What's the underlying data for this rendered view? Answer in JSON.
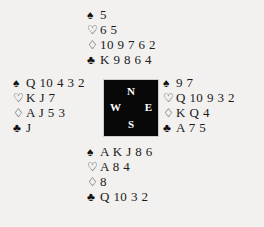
{
  "deal": {
    "suit_symbols": {
      "spade": "♠",
      "heart": "♡",
      "diamond": "♢",
      "club": "♣"
    },
    "compass": {
      "north": "N",
      "east": "E",
      "south": "S",
      "west": "W",
      "background_color": "#080808",
      "text_color": "#ffffff"
    },
    "hands": {
      "north": {
        "label": "North",
        "spades": "5",
        "hearts": "6 5",
        "diamonds": "10 9 7 6 2",
        "clubs": "K 9 8 6 4"
      },
      "west": {
        "label": "West",
        "spades": "Q 10 4 3 2",
        "hearts": "K J 7",
        "diamonds": "A J 5 3",
        "clubs": "J"
      },
      "east": {
        "label": "East",
        "spades": "9 7",
        "hearts": "Q 10 9 3 2",
        "diamonds": "K Q 4",
        "clubs": "A 7 5"
      },
      "south": {
        "label": "South",
        "spades": "A K J 8 6",
        "hearts": "A 8 4",
        "diamonds": "8",
        "clubs": "Q 10 3 2"
      }
    }
  }
}
